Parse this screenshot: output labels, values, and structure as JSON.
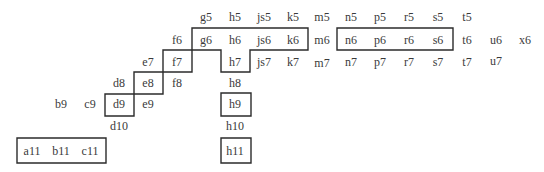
{
  "diagram": {
    "type": "cell-grid-with-outlined-regions",
    "colors": {
      "text": "#3a3a3a",
      "outline": "#2b2b2b",
      "background": "#ffffff"
    },
    "cells": [
      {
        "label": "g5",
        "x": 206,
        "y": 17
      },
      {
        "label": "h5",
        "x": 235,
        "y": 17
      },
      {
        "label": "js5",
        "x": 264,
        "y": 17
      },
      {
        "label": "k5",
        "x": 293,
        "y": 17
      },
      {
        "label": "m5",
        "x": 322,
        "y": 17
      },
      {
        "label": "n5",
        "x": 351,
        "y": 17
      },
      {
        "label": "p5",
        "x": 380,
        "y": 17
      },
      {
        "label": "r5",
        "x": 409,
        "y": 17
      },
      {
        "label": "s5",
        "x": 438,
        "y": 17
      },
      {
        "label": "t5",
        "x": 467,
        "y": 17
      },
      {
        "label": "f6",
        "x": 177,
        "y": 40
      },
      {
        "label": "g6",
        "x": 206,
        "y": 40
      },
      {
        "label": "h6",
        "x": 235,
        "y": 40
      },
      {
        "label": "js6",
        "x": 264,
        "y": 40
      },
      {
        "label": "k6",
        "x": 293,
        "y": 40
      },
      {
        "label": "m6",
        "x": 322,
        "y": 40
      },
      {
        "label": "n6",
        "x": 351,
        "y": 40
      },
      {
        "label": "p6",
        "x": 380,
        "y": 40
      },
      {
        "label": "r6",
        "x": 409,
        "y": 40
      },
      {
        "label": "s6",
        "x": 438,
        "y": 40
      },
      {
        "label": "t6",
        "x": 467,
        "y": 40
      },
      {
        "label": "u6",
        "x": 496,
        "y": 40
      },
      {
        "label": "x6",
        "x": 525,
        "y": 40
      },
      {
        "label": "e7",
        "x": 148,
        "y": 62
      },
      {
        "label": "f7",
        "x": 177,
        "y": 62
      },
      {
        "label": "h7",
        "x": 235,
        "y": 62
      },
      {
        "label": "js7",
        "x": 264,
        "y": 62
      },
      {
        "label": "k7",
        "x": 293,
        "y": 62
      },
      {
        "label": "m7",
        "x": 322,
        "y": 63
      },
      {
        "label": "n7",
        "x": 351,
        "y": 62
      },
      {
        "label": "p7",
        "x": 380,
        "y": 62
      },
      {
        "label": "r7",
        "x": 409,
        "y": 62
      },
      {
        "label": "s7",
        "x": 438,
        "y": 62
      },
      {
        "label": "t7",
        "x": 467,
        "y": 62
      },
      {
        "label": "u7",
        "x": 496,
        "y": 61
      },
      {
        "label": "d8",
        "x": 119,
        "y": 83
      },
      {
        "label": "e8",
        "x": 148,
        "y": 83
      },
      {
        "label": "f8",
        "x": 177,
        "y": 83
      },
      {
        "label": "h8",
        "x": 235,
        "y": 83
      },
      {
        "label": "b9",
        "x": 61,
        "y": 104
      },
      {
        "label": "c9",
        "x": 90,
        "y": 104
      },
      {
        "label": "d9",
        "x": 119,
        "y": 104
      },
      {
        "label": "e9",
        "x": 148,
        "y": 104
      },
      {
        "label": "h9",
        "x": 235,
        "y": 104
      },
      {
        "label": "d10",
        "x": 119,
        "y": 126
      },
      {
        "label": "h10",
        "x": 235,
        "y": 126
      },
      {
        "label": "a11",
        "x": 32,
        "y": 151
      },
      {
        "label": "b11",
        "x": 61,
        "y": 151
      },
      {
        "label": "c11",
        "x": 90,
        "y": 151
      },
      {
        "label": "h11",
        "x": 235,
        "y": 151
      }
    ],
    "outlines": [
      {
        "name": "staircase-region",
        "covers": [
          "g6",
          "h6",
          "js6",
          "k6",
          "f7",
          "h7",
          "e8",
          "d9"
        ],
        "d": "M192 28 L308 28 L308 50 L250 50 L250 72 L221 72 L221 50 L192 50 Z M163 50 L192 50 L192 72 L163 72 Z M134 72 L163 72 L163 94 L134 94 Z M105 94 L134 94 L134 116 L105 116 Z"
      },
      {
        "name": "n6-s6-box",
        "covers": [
          "n6",
          "p6",
          "r6",
          "s6"
        ],
        "d": "M337 28 L453 28 L453 50 L337 50 Z"
      },
      {
        "name": "h9-box",
        "covers": [
          "h9"
        ],
        "d": "M221 93 L251 93 L251 116 L221 116 Z"
      },
      {
        "name": "a11-c11-box",
        "covers": [
          "a11",
          "b11",
          "c11"
        ],
        "d": "M17 138 L106 138 L106 163 L17 163 Z"
      },
      {
        "name": "h11-box",
        "covers": [
          "h11"
        ],
        "d": "M221 138 L251 138 L251 163 L221 163 Z"
      }
    ]
  }
}
